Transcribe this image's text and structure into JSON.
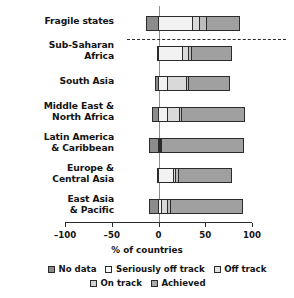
{
  "chart_data": {
    "type": "bar",
    "orientation": "horizontal",
    "stacked": true,
    "title": "",
    "xlabel": "% of countries",
    "ylabel": "",
    "xlim": [
      -100,
      100
    ],
    "xticks": [
      -100,
      -50,
      0,
      50,
      100
    ],
    "xtick_labels": [
      "–100",
      "–50",
      "0",
      "50",
      "100"
    ],
    "grid": false,
    "legend_position": "bottom",
    "zero_reference_line": true,
    "separator_after_category": "Fragile states",
    "categories": [
      "Fragile states",
      "Sub-Saharan Africa",
      "South Asia",
      "Middle East & North Africa",
      "Latin America & Caribbean",
      "Europe & Central Asia",
      "East Asia & Pacific"
    ],
    "category_label_lines": [
      [
        "Fragile states"
      ],
      [
        "Sub-Saharan",
        "Africa"
      ],
      [
        "South Asia"
      ],
      [
        "Middle East &",
        "North Africa"
      ],
      [
        "Latin America",
        "& Caribbean"
      ],
      [
        "Europe &",
        "Central Asia"
      ],
      [
        "East Asia",
        "& Pacific"
      ]
    ],
    "series": [
      {
        "name": "No data",
        "color": "#8c8c8c",
        "values": [
          13,
          2,
          4,
          7,
          10,
          2,
          10
        ]
      },
      {
        "name": "Seriously off track",
        "color": "#f2f2f2",
        "values": [
          37,
          26,
          10,
          9,
          1,
          16,
          3
        ]
      },
      {
        "name": "Off track",
        "color": "#d9d9d9",
        "values": [
          8,
          6,
          20,
          14,
          1,
          2,
          6
        ]
      },
      {
        "name": "On track",
        "color": "#bcbcbc",
        "values": [
          7,
          4,
          2,
          2,
          1,
          3,
          4
        ]
      },
      {
        "name": "Achieved",
        "color": "#a0a0a0",
        "values": [
          35,
          43,
          45,
          68,
          88,
          58,
          77
        ]
      }
    ],
    "bar_starts": [
      -13,
      -2,
      -4,
      -7,
      -10,
      -2,
      -10
    ],
    "bar_ends": [
      87,
      79,
      77,
      93,
      91,
      79,
      90
    ],
    "annotations": []
  },
  "legend": {
    "rows": [
      [
        {
          "label": "No data",
          "color": "#8c8c8c"
        },
        {
          "label": "Seriously off track",
          "color": "#f7f7f7"
        },
        {
          "label": "Off track",
          "color": "#e2e2e2"
        }
      ],
      [
        {
          "label": "On track",
          "color": "#d0d0d0"
        },
        {
          "label": "Achieved",
          "color": "#ababab"
        }
      ]
    ]
  },
  "axis": {
    "title": "% of countries",
    "ticks": [
      {
        "value": -100,
        "label": "–100"
      },
      {
        "value": -50,
        "label": "–50"
      },
      {
        "value": 0,
        "label": "0"
      },
      {
        "value": 50,
        "label": "50"
      },
      {
        "value": 100,
        "label": "100"
      }
    ]
  }
}
